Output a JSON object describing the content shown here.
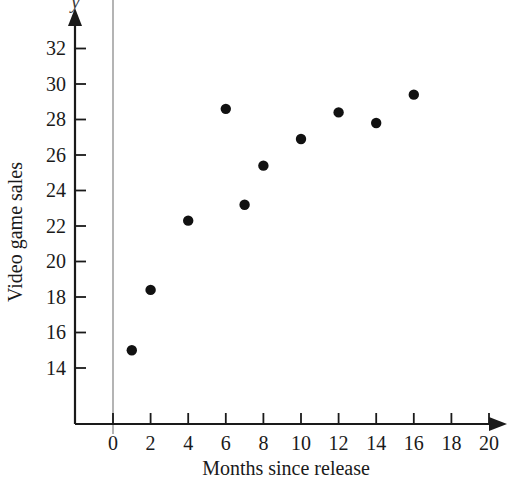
{
  "chart_data": {
    "type": "scatter",
    "title": "",
    "subtitle": "",
    "xlabel": "Months since release",
    "ylabel": "Video game sales",
    "xlim": [
      0,
      20
    ],
    "ylim": [
      13,
      33
    ],
    "xticks": [
      "0",
      "2",
      "4",
      "6",
      "8",
      "10",
      "12",
      "14",
      "16",
      "18",
      "20"
    ],
    "yticks": [
      "14",
      "16",
      "18",
      "20",
      "22",
      "24",
      "26",
      "28",
      "30",
      "32"
    ],
    "grid": false,
    "legend": null,
    "axis_style": "arrow-terminated-axes",
    "marker": "filled-circle",
    "marker_color": "#111111",
    "x": [
      1,
      2,
      4,
      6,
      7,
      8,
      10,
      12,
      14,
      16
    ],
    "y": [
      15.0,
      18.4,
      22.3,
      28.6,
      23.2,
      25.4,
      26.9,
      28.4,
      27.8,
      29.4
    ],
    "points": [
      {
        "x": 1,
        "y": 15.0
      },
      {
        "x": 2,
        "y": 18.4
      },
      {
        "x": 4,
        "y": 22.3
      },
      {
        "x": 6,
        "y": 28.6
      },
      {
        "x": 7,
        "y": 23.2
      },
      {
        "x": 8,
        "y": 25.4
      },
      {
        "x": 10,
        "y": 26.9
      },
      {
        "x": 12,
        "y": 28.4
      },
      {
        "x": 14,
        "y": 27.8
      },
      {
        "x": 16,
        "y": 29.4
      }
    ],
    "annotations": [
      {
        "name": "axis-variable-letter",
        "text": "y",
        "position": "above-y-axis-arrow",
        "clipped": true
      }
    ]
  }
}
